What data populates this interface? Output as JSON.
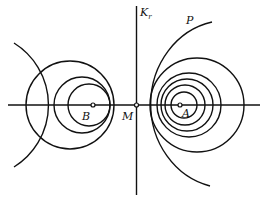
{
  "diagram": {
    "labels": {
      "axis_vertical": "K",
      "axis_vertical_sub": "r",
      "curve_p": "P",
      "point_a": "A",
      "point_b": "B",
      "point_m": "M"
    },
    "colors": {
      "stroke": "#111111",
      "background": "#ffffff"
    }
  }
}
